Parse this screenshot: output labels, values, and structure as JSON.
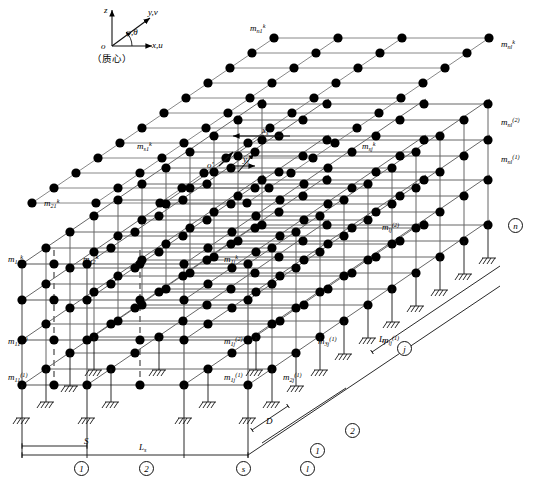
{
  "figure": {
    "type": "engineering-schematic"
  },
  "coordinate_system": {
    "origin_label": "o",
    "axis_z": "z",
    "axis_y": "y,v",
    "axis_x": "x,u",
    "angle_label": "φ,θ",
    "note": "（质心）"
  },
  "local_frame": {
    "origin_label": "o'",
    "axis_x": "x",
    "axis_x_sub": "s",
    "axis_x_sup": "k",
    "axis_y": "y",
    "axis_y_sub": "j",
    "axis_y_sup": "k"
  },
  "mass_labels": [
    {
      "id": "m-n1-k",
      "base": "m",
      "sub": "n1",
      "sup": "k",
      "x": 250,
      "y": 24
    },
    {
      "id": "m-nl-k",
      "base": "m",
      "sub": "nl",
      "sup": "k",
      "x": 501,
      "y": 40
    },
    {
      "id": "m-nl-2",
      "base": "m",
      "sub": "nl",
      "sup": "(2)",
      "x": 501,
      "y": 118
    },
    {
      "id": "m-nl-1",
      "base": "m",
      "sub": "nl",
      "sup": "(1)",
      "x": 501,
      "y": 155
    },
    {
      "id": "m-s1-k",
      "base": "m",
      "sub": "s1",
      "sup": "k",
      "x": 137,
      "y": 142
    },
    {
      "id": "m-sj-k",
      "base": "m",
      "sub": "sj",
      "sup": "k",
      "x": 362,
      "y": 142
    },
    {
      "id": "m-21-k",
      "base": "m",
      "sub": "21",
      "sup": "k",
      "x": 44,
      "y": 199
    },
    {
      "id": "m-lj-2",
      "base": "m",
      "sub": "lj",
      "sup": "(2)",
      "x": 382,
      "y": 223
    },
    {
      "id": "m-11-k",
      "base": "m",
      "sub": "11",
      "sup": "k",
      "x": 8,
      "y": 255
    },
    {
      "id": "m-12-k",
      "base": "m",
      "sub": "12",
      "sup": "k",
      "x": 83,
      "y": 255
    },
    {
      "id": "m-1j-k",
      "base": "m",
      "sub": "1j",
      "sup": "k",
      "x": 224,
      "y": 255
    },
    {
      "id": "m-lj-1",
      "base": "m",
      "sub": "lj",
      "sup": "(1)",
      "x": 382,
      "y": 336
    },
    {
      "id": "m-11-2",
      "base": "m",
      "sub": "11",
      "sup": "(2)",
      "x": 8,
      "y": 337
    },
    {
      "id": "m-1j-2",
      "base": "m",
      "sub": "1j",
      "sup": "(2)",
      "x": 224,
      "y": 337
    },
    {
      "id": "m-3j-1",
      "base": "m",
      "sub": "3j",
      "sup": "(1)",
      "x": 318,
      "y": 337
    },
    {
      "id": "m-11-1",
      "base": "m",
      "sub": "11",
      "sup": "(1)",
      "x": 8,
      "y": 373
    },
    {
      "id": "m-1j-1",
      "base": "m",
      "sub": "1j",
      "sup": "(1)",
      "x": 224,
      "y": 373
    },
    {
      "id": "m-2j-1",
      "base": "m",
      "sub": "2j",
      "sup": "(1)",
      "x": 283,
      "y": 373
    }
  ],
  "dimensions": [
    {
      "id": "dim-S",
      "base": "S",
      "sub": "",
      "x": 84,
      "y": 437
    },
    {
      "id": "dim-Ls",
      "base": "L",
      "sub": "s",
      "x": 139,
      "y": 443
    },
    {
      "id": "dim-D",
      "base": "D",
      "sub": "",
      "x": 266,
      "y": 417
    },
    {
      "id": "dim-Lj",
      "base": "L",
      "sub": "j",
      "x": 379,
      "y": 335
    }
  ],
  "node_markers": [
    {
      "id": "marker-1-bottom",
      "label": "1",
      "x": 74,
      "y": 461
    },
    {
      "id": "marker-2-bottom",
      "label": "2",
      "x": 139,
      "y": 461
    },
    {
      "id": "marker-s-bottom",
      "label": "s",
      "x": 236,
      "y": 461
    },
    {
      "id": "marker-l-bottom",
      "label": "l",
      "x": 300,
      "y": 461
    },
    {
      "id": "marker-1-depth",
      "label": "1",
      "x": 310,
      "y": 443
    },
    {
      "id": "marker-2-depth",
      "label": "2",
      "x": 345,
      "y": 423
    },
    {
      "id": "marker-j-depth",
      "label": "j",
      "x": 397,
      "y": 341
    },
    {
      "id": "marker-n-depth",
      "label": "n",
      "x": 508,
      "y": 218
    }
  ],
  "colors": {
    "node": "#000000",
    "line": "#555555",
    "dark_line": "#111111",
    "background": "#ffffff"
  }
}
